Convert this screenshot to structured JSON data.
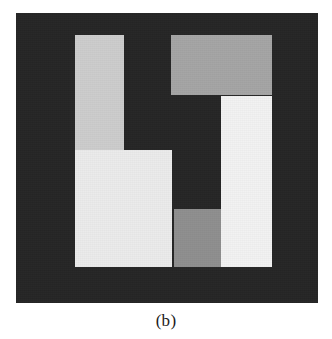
{
  "figure": {
    "caption": "(b)",
    "page_background": "#ffffff",
    "canvas": {
      "name": "segmented-image-canvas",
      "background_color": "#262626",
      "x": 16,
      "y": 13,
      "width": 302,
      "height": 290
    },
    "regions": [
      {
        "id": "upper-left-column",
        "label": "light-gray vertical bar, upper left",
        "color": "#cdcdcd",
        "x": 59,
        "y": 22,
        "width": 49,
        "height": 128
      },
      {
        "id": "lower-left-block",
        "label": "bright near-white block, lower left",
        "color": "#ebebeb",
        "x": 59,
        "y": 137,
        "width": 97,
        "height": 117
      },
      {
        "id": "upper-right-block",
        "label": "medium-gray block, upper right",
        "color": "#a5a5a5",
        "x": 155,
        "y": 22,
        "width": 101,
        "height": 60
      },
      {
        "id": "right-column",
        "label": "brightest white vertical bar, right",
        "color": "#f2f2f2",
        "x": 205,
        "y": 83,
        "width": 51,
        "height": 171
      },
      {
        "id": "bottom-middle-block",
        "label": "dark-gray block, bottom middle",
        "color": "#8f8f8f",
        "x": 158,
        "y": 196,
        "width": 47,
        "height": 58
      }
    ]
  }
}
